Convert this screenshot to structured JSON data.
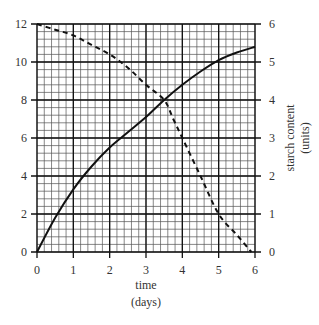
{
  "chart_data": {
    "type": "line",
    "title": "",
    "xlabel": "time",
    "xlabel_units": "(days)",
    "ylabel": "",
    "y2label": "starch content",
    "y2label_units": "(units)",
    "xlim": [
      0,
      6
    ],
    "ylim": [
      0,
      12
    ],
    "y2lim": [
      0,
      6
    ],
    "x_ticks": [
      "0",
      "1",
      "2",
      "3",
      "4",
      "5",
      "6"
    ],
    "y_ticks": [
      "0",
      "2",
      "4",
      "6",
      "8",
      "10",
      "12"
    ],
    "y2_ticks": [
      "0",
      "1",
      "2",
      "3",
      "4",
      "5",
      "6"
    ],
    "grid": true,
    "grid_minor_per_major": 5,
    "series": [
      {
        "name": "solid curve (left axis)",
        "style": "solid",
        "axis": "left",
        "x": [
          0,
          0.5,
          1,
          1.5,
          2,
          2.5,
          3,
          3.5,
          4,
          4.5,
          5,
          5.5,
          6
        ],
        "values": [
          0,
          1.8,
          3.3,
          4.5,
          5.5,
          6.3,
          7.1,
          8.0,
          8.8,
          9.5,
          10.1,
          10.5,
          10.8
        ]
      },
      {
        "name": "starch content (dashed, right axis)",
        "style": "dashed",
        "axis": "right",
        "x": [
          0,
          0.5,
          1,
          1.5,
          2,
          2.5,
          3,
          3.5,
          3.75,
          4,
          4.5,
          5,
          5.5,
          5.9
        ],
        "values": [
          6.0,
          5.85,
          5.7,
          5.45,
          5.2,
          4.85,
          4.4,
          4.0,
          3.5,
          3.0,
          2.0,
          1.0,
          0.45,
          0.0
        ]
      }
    ]
  }
}
